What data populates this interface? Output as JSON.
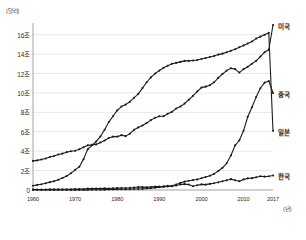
{
  "chart_data": {
    "type": "line",
    "title": "",
    "xlabel": "(년)",
    "ylabel": "(달러)",
    "y_unit_label": "(달러)",
    "x_unit_label": "(년)",
    "grid": true,
    "legend_position": "right-end-of-line",
    "xlim": [
      1960,
      2017
    ],
    "ylim": [
      0,
      17
    ],
    "yticks": [
      0,
      2,
      4,
      6,
      8,
      10,
      12,
      14,
      16
    ],
    "ytick_labels": [
      "0",
      "2조",
      "4조",
      "6조",
      "8조",
      "10조",
      "12조",
      "14조",
      "16조"
    ],
    "xticks": [
      1960,
      1970,
      1980,
      1990,
      2000,
      2010,
      2017
    ],
    "xtick_labels": [
      "1960",
      "1970",
      "1980",
      "1990",
      "2000",
      "2010",
      "2017"
    ],
    "x": [
      1960,
      1961,
      1962,
      1963,
      1964,
      1965,
      1966,
      1967,
      1968,
      1969,
      1970,
      1971,
      1972,
      1973,
      1974,
      1975,
      1976,
      1977,
      1978,
      1979,
      1980,
      1981,
      1982,
      1983,
      1984,
      1985,
      1986,
      1987,
      1988,
      1989,
      1990,
      1991,
      1992,
      1993,
      1994,
      1995,
      1996,
      1997,
      1998,
      1999,
      2000,
      2001,
      2002,
      2003,
      2004,
      2005,
      2006,
      2007,
      2008,
      2009,
      2010,
      2011,
      2012,
      2013,
      2014,
      2015,
      2016,
      2017
    ],
    "series": [
      {
        "name": "미국",
        "label": "미국",
        "color": "#1c1c1c",
        "end_value": 17.0,
        "values": [
          3.0,
          3.05,
          3.15,
          3.25,
          3.4,
          3.5,
          3.65,
          3.75,
          3.9,
          4.0,
          4.05,
          4.2,
          4.4,
          4.6,
          4.65,
          4.7,
          4.9,
          5.1,
          5.35,
          5.5,
          5.5,
          5.65,
          5.55,
          5.8,
          6.2,
          6.45,
          6.65,
          6.9,
          7.2,
          7.45,
          7.6,
          7.6,
          7.85,
          8.05,
          8.4,
          8.6,
          8.9,
          9.3,
          9.7,
          10.15,
          10.55,
          10.65,
          10.8,
          11.1,
          11.55,
          11.95,
          12.3,
          12.55,
          12.45,
          12.1,
          12.45,
          12.7,
          13.0,
          13.3,
          13.75,
          14.2,
          14.45,
          17.0
        ]
      },
      {
        "name": "중국",
        "label": "중국",
        "color": "#1c1c1c",
        "end_value": 10.0,
        "values": [
          0.06,
          0.05,
          0.05,
          0.05,
          0.06,
          0.07,
          0.08,
          0.07,
          0.07,
          0.08,
          0.09,
          0.1,
          0.11,
          0.14,
          0.14,
          0.16,
          0.15,
          0.17,
          0.15,
          0.18,
          0.19,
          0.2,
          0.21,
          0.23,
          0.26,
          0.31,
          0.3,
          0.27,
          0.31,
          0.35,
          0.36,
          0.38,
          0.43,
          0.44,
          0.56,
          0.73,
          0.86,
          0.96,
          1.03,
          1.09,
          1.21,
          1.34,
          1.47,
          1.66,
          1.96,
          2.29,
          2.75,
          3.55,
          4.6,
          5.1,
          6.1,
          7.55,
          8.53,
          9.57,
          10.48,
          11.06,
          11.23,
          10.0
        ]
      },
      {
        "name": "일본",
        "label": "일본",
        "color": "#1c1c1c",
        "end_value": 6.1,
        "values": [
          0.44,
          0.53,
          0.6,
          0.69,
          0.81,
          0.91,
          1.06,
          1.23,
          1.45,
          1.72,
          2.07,
          2.4,
          3.18,
          4.2,
          4.6,
          5.0,
          5.5,
          6.2,
          7.0,
          7.6,
          8.2,
          8.6,
          8.8,
          9.1,
          9.5,
          9.9,
          10.5,
          11.1,
          11.6,
          12.0,
          12.3,
          12.6,
          12.8,
          13.0,
          13.1,
          13.2,
          13.3,
          13.3,
          13.35,
          13.4,
          13.5,
          13.6,
          13.7,
          13.8,
          13.95,
          14.05,
          14.2,
          14.35,
          14.5,
          14.7,
          14.9,
          15.1,
          15.3,
          15.6,
          15.8,
          16.0,
          16.2,
          6.1
        ]
      },
      {
        "name": "한국",
        "label": "한국",
        "color": "#1c1c1c",
        "end_value": 1.5,
        "values": [
          0.004,
          0.004,
          0.003,
          0.004,
          0.004,
          0.003,
          0.004,
          0.005,
          0.006,
          0.007,
          0.009,
          0.01,
          0.011,
          0.014,
          0.019,
          0.021,
          0.029,
          0.037,
          0.051,
          0.062,
          0.065,
          0.072,
          0.078,
          0.087,
          0.096,
          0.1,
          0.115,
          0.147,
          0.197,
          0.243,
          0.28,
          0.326,
          0.356,
          0.393,
          0.46,
          0.566,
          0.61,
          0.57,
          0.38,
          0.49,
          0.58,
          0.55,
          0.63,
          0.7,
          0.79,
          0.9,
          1.01,
          1.12,
          1.0,
          0.9,
          1.09,
          1.2,
          1.22,
          1.31,
          1.41,
          1.38,
          1.41,
          1.5
        ]
      }
    ],
    "notes": {
      "us_dip_years": [
        2008,
        2009
      ],
      "china_crosses_japan": 2010
    }
  },
  "axis": {
    "y_unit": "(달러)",
    "x_unit": "(년)"
  }
}
